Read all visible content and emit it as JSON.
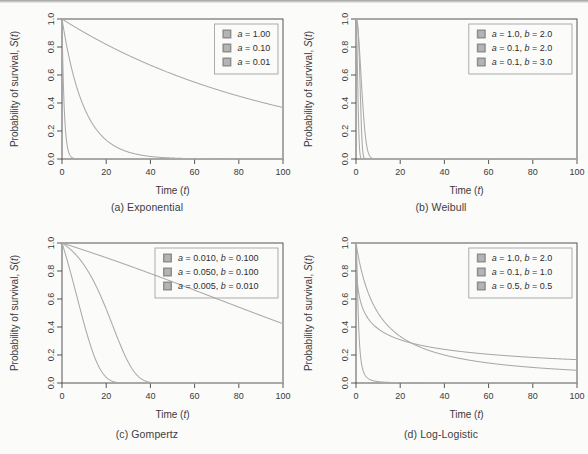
{
  "figure": {
    "axis_titles": {
      "x": "Time (t)",
      "y": "Probability of survival, S(t)"
    },
    "x_ticks": [
      "0",
      "20",
      "40",
      "60",
      "80",
      "100"
    ],
    "y_ticks": [
      "0.0",
      "0.2",
      "0.4",
      "0.6",
      "0.8",
      "1.0"
    ],
    "curve_color": "#a9a9a9",
    "swatch_color": "#b4b4b4",
    "swatch_border": "#8f8f8f"
  },
  "panels": [
    {
      "id": "exponential",
      "caption": "(a) Exponential",
      "legend": [
        "a = 1.00",
        "a = 0.10",
        "a = 0.01"
      ]
    },
    {
      "id": "weibull",
      "caption": "(b) Weibull",
      "legend": [
        "a = 1.0, b = 2.0",
        "a = 0.1, b = 2.0",
        "a = 0.1, b = 3.0"
      ]
    },
    {
      "id": "gompertz",
      "caption": "(c) Gompertz",
      "legend": [
        "a = 0.010, b = 0.100",
        "a = 0.050, b = 0.100",
        "a = 0.005, b = 0.010"
      ]
    },
    {
      "id": "loglogistic",
      "caption": "(d) Log-Logistic",
      "legend": [
        "a = 1.0, b = 2.0",
        "a = 0.1, b = 1.0",
        "a = 0.5, b = 0.5"
      ]
    }
  ],
  "chart_data": [
    {
      "type": "line",
      "id": "exponential",
      "title": "(a) Exponential",
      "xlabel": "Time (t)",
      "ylabel": "Probability of survival, S(t)",
      "xlim": [
        0,
        100
      ],
      "ylim": [
        0.0,
        1.0
      ],
      "xticks": [
        0,
        20,
        40,
        60,
        80,
        100
      ],
      "yticks": [
        0.0,
        0.2,
        0.4,
        0.6,
        0.8,
        1.0
      ],
      "grid": false,
      "legend_position": "top-right",
      "formula": "S(t) = exp(-a*t)",
      "series": [
        {
          "name": "a = 1.00",
          "a": 1.0,
          "x": [
            0,
            1,
            2,
            3,
            4,
            5,
            6,
            8,
            10,
            20,
            40,
            60,
            80,
            100
          ],
          "values": [
            1.0,
            0.368,
            0.135,
            0.05,
            0.018,
            0.007,
            0.002,
            0.0003,
            5e-05,
            0.0,
            0.0,
            0.0,
            0.0,
            0.0
          ]
        },
        {
          "name": "a = 0.10",
          "a": 0.1,
          "x": [
            0,
            5,
            10,
            15,
            20,
            25,
            30,
            40,
            50,
            60,
            70,
            80,
            90,
            100
          ],
          "values": [
            1.0,
            0.607,
            0.368,
            0.223,
            0.135,
            0.082,
            0.05,
            0.018,
            0.007,
            0.002,
            0.001,
            0.0003,
            0.0001,
            5e-05
          ]
        },
        {
          "name": "a = 0.01",
          "a": 0.01,
          "x": [
            0,
            10,
            20,
            30,
            40,
            50,
            60,
            70,
            80,
            90,
            100
          ],
          "values": [
            1.0,
            0.905,
            0.819,
            0.741,
            0.67,
            0.607,
            0.549,
            0.497,
            0.449,
            0.407,
            0.368
          ]
        }
      ]
    },
    {
      "type": "line",
      "id": "weibull",
      "title": "(b) Weibull",
      "xlabel": "Time (t)",
      "ylabel": "Probability of survival, S(t)",
      "xlim": [
        0,
        100
      ],
      "ylim": [
        0.0,
        1.0
      ],
      "xticks": [
        0,
        20,
        40,
        60,
        80,
        100
      ],
      "yticks": [
        0.0,
        0.2,
        0.4,
        0.6,
        0.8,
        1.0
      ],
      "grid": false,
      "legend_position": "top-right",
      "formula": "S(t) = exp(-a*t^b)",
      "series": [
        {
          "name": "a = 1.0, b = 2.0",
          "a": 1.0,
          "b": 2.0,
          "x": [
            0,
            0.5,
            1,
            1.5,
            2,
            2.5,
            3,
            4,
            5,
            10,
            20,
            100
          ],
          "values": [
            1.0,
            0.779,
            0.368,
            0.105,
            0.018,
            0.002,
            0.0001,
            0.0,
            0.0,
            0.0,
            0.0,
            0.0
          ]
        },
        {
          "name": "a = 0.1, b = 2.0",
          "a": 0.1,
          "b": 2.0,
          "x": [
            0,
            1,
            2,
            3,
            4,
            5,
            6,
            7,
            8,
            10,
            12,
            15,
            20,
            100
          ],
          "values": [
            0.905,
            0.905,
            0.67,
            0.407,
            0.202,
            0.082,
            0.027,
            0.007,
            0.002,
            5e-05,
            0.0,
            0.0,
            0.0,
            0.0
          ]
        },
        {
          "name": "a = 0.1, b = 3.0",
          "a": 0.1,
          "b": 3.0,
          "x": [
            0,
            2,
            4,
            6,
            8,
            10,
            12,
            14,
            16,
            18,
            20,
            25,
            100
          ],
          "values": [
            1.0,
            0.923,
            0.527,
            0.115,
            0.006,
            0.0001,
            0.0,
            0.0,
            0.0,
            0.0,
            0.0,
            0.0,
            0.0
          ]
        }
      ]
    },
    {
      "type": "line",
      "id": "gompertz",
      "title": "(c) Gompertz",
      "xlabel": "Time (t)",
      "ylabel": "Probability of survival, S(t)",
      "xlim": [
        0,
        100
      ],
      "ylim": [
        0.0,
        1.0
      ],
      "xticks": [
        0,
        20,
        40,
        60,
        80,
        100
      ],
      "yticks": [
        0.0,
        0.2,
        0.4,
        0.6,
        0.8,
        1.0
      ],
      "grid": false,
      "legend_position": "top-right",
      "formula": "S(t) = exp(-(a/b)*(exp(b*t)-1))",
      "series": [
        {
          "name": "a = 0.010, b = 0.100",
          "a": 0.01,
          "b": 0.1,
          "x": [
            0,
            5,
            10,
            15,
            20,
            25,
            30,
            35,
            40,
            50,
            60,
            100
          ],
          "values": [
            1.0,
            0.938,
            0.843,
            0.693,
            0.477,
            0.222,
            0.039,
            0.001,
            0.0,
            0.0,
            0.0,
            0.0
          ]
        },
        {
          "name": "a = 0.050, b = 0.100",
          "a": 0.05,
          "b": 0.1,
          "x": [
            0,
            2,
            5,
            8,
            10,
            12,
            15,
            18,
            20,
            25,
            30,
            100
          ],
          "values": [
            1.0,
            0.896,
            0.731,
            0.54,
            0.412,
            0.288,
            0.137,
            0.046,
            0.019,
            0.001,
            0.0,
            0.0
          ]
        },
        {
          "name": "a = 0.005, b = 0.010",
          "a": 0.005,
          "b": 0.01,
          "x": [
            0,
            10,
            20,
            30,
            40,
            50,
            60,
            70,
            80,
            90,
            100
          ],
          "values": [
            1.0,
            0.949,
            0.895,
            0.839,
            0.781,
            0.722,
            0.662,
            0.602,
            0.542,
            0.482,
            0.424
          ]
        }
      ]
    },
    {
      "type": "line",
      "id": "loglogistic",
      "title": "(d) Log-Logistic",
      "xlabel": "Time (t)",
      "ylabel": "Probability of survival, S(t)",
      "xlim": [
        0,
        100
      ],
      "ylim": [
        0.0,
        1.0
      ],
      "xticks": [
        0,
        20,
        40,
        60,
        80,
        100
      ],
      "yticks": [
        0.0,
        0.2,
        0.4,
        0.6,
        0.8,
        1.0
      ],
      "grid": false,
      "legend_position": "top-right",
      "formula": "S(t) = 1 / (1 + a*t^b)",
      "series": [
        {
          "name": "a = 1.0, b = 2.0",
          "a": 1.0,
          "b": 2.0,
          "x": [
            0,
            1,
            2,
            3,
            5,
            8,
            10,
            20,
            40,
            60,
            80,
            100
          ],
          "values": [
            1.0,
            0.5,
            0.2,
            0.1,
            0.038,
            0.015,
            0.01,
            0.002,
            0.001,
            0.0003,
            0.0002,
            0.0001
          ]
        },
        {
          "name": "a = 0.1, b = 1.0",
          "a": 0.1,
          "b": 1.0,
          "x": [
            0,
            2,
            5,
            10,
            20,
            30,
            40,
            50,
            60,
            70,
            80,
            90,
            100
          ],
          "values": [
            1.0,
            0.833,
            0.667,
            0.5,
            0.333,
            0.25,
            0.2,
            0.167,
            0.143,
            0.125,
            0.111,
            0.1,
            0.091
          ]
        },
        {
          "name": "a = 0.5, b = 0.5",
          "a": 0.5,
          "b": 0.5,
          "x": [
            0,
            1,
            2,
            5,
            10,
            20,
            30,
            40,
            50,
            60,
            80,
            100
          ],
          "values": [
            1.0,
            0.667,
            0.586,
            0.472,
            0.387,
            0.309,
            0.268,
            0.24,
            0.221,
            0.205,
            0.183,
            0.167
          ]
        }
      ]
    }
  ]
}
